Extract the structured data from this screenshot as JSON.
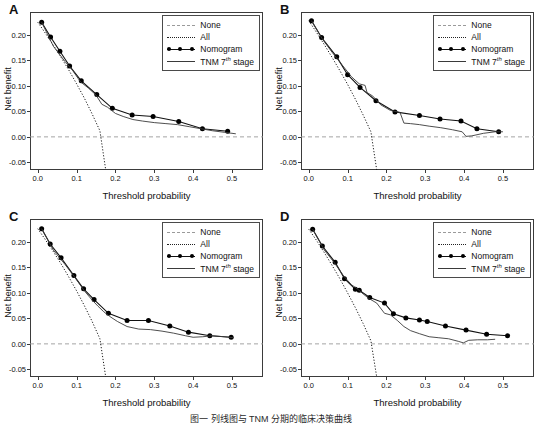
{
  "figure": {
    "caption": "图一 列线图与 TNM 分期的临床决策曲线",
    "panels": [
      "A",
      "B",
      "C",
      "D"
    ]
  },
  "axes": {
    "xlabel": "Threshold probability",
    "ylabel": "Net benefit",
    "xticks": [
      "0.0",
      "0.1",
      "0.2",
      "0.3",
      "0.4",
      "0.5"
    ],
    "xtick_values": [
      0.0,
      0.1,
      0.2,
      0.3,
      0.4,
      0.5
    ],
    "yticks": [
      "-0.05",
      "0.00",
      "0.05",
      "0.10",
      "0.15",
      "0.20"
    ],
    "ytick_values": [
      -0.05,
      0.0,
      0.05,
      0.1,
      0.15,
      0.2
    ],
    "xlim": [
      -0.02,
      0.58
    ],
    "ylim": [
      -0.065,
      0.245
    ]
  },
  "legend": {
    "items": [
      {
        "label": "None",
        "style": "dashed-gray"
      },
      {
        "label": "All",
        "style": "dotted-black"
      },
      {
        "label": "Nomogram",
        "style": "line-with-dots"
      },
      {
        "label": "TNM 7th stage",
        "style": "solid-black",
        "prefix": "TNM 7",
        "superscript": "th",
        "suffix": " stage"
      }
    ]
  },
  "chart_data": {
    "type": "line",
    "xlabel": "Threshold probability",
    "ylabel": "Net benefit",
    "xlim": [
      -0.02,
      0.58
    ],
    "ylim": [
      -0.065,
      0.245
    ],
    "grid": false,
    "legend_position": "top-right",
    "panels": [
      {
        "label": "A",
        "series": [
          {
            "name": "None",
            "type": "horizontal-line",
            "value": 0.0,
            "x": [
              -0.02,
              0.58
            ],
            "y": [
              0.0,
              0.0
            ]
          },
          {
            "name": "All",
            "type": "line",
            "x": [
              0.0,
              0.02,
              0.04,
              0.06,
              0.08,
              0.1,
              0.12,
              0.14,
              0.16,
              0.175
            ],
            "y": [
              0.225,
              0.203,
              0.18,
              0.156,
              0.131,
              0.104,
              0.076,
              0.045,
              0.012,
              -0.065
            ]
          },
          {
            "name": "Nomogram",
            "type": "line-markers",
            "x": [
              0.01,
              0.033,
              0.057,
              0.082,
              0.112,
              0.152,
              0.192,
              0.243,
              0.297,
              0.363,
              0.424,
              0.489
            ],
            "y": [
              0.225,
              0.196,
              0.168,
              0.139,
              0.11,
              0.083,
              0.056,
              0.043,
              0.04,
              0.03,
              0.016,
              0.011
            ]
          },
          {
            "name": "TNM 7th stage",
            "type": "line",
            "x": [
              0.01,
              0.04,
              0.07,
              0.09,
              0.11,
              0.13,
              0.15,
              0.165,
              0.18,
              0.2,
              0.22,
              0.245,
              0.27,
              0.3,
              0.33,
              0.36,
              0.39,
              0.42,
              0.45,
              0.48,
              0.51
            ],
            "y": [
              0.225,
              0.178,
              0.148,
              0.13,
              0.108,
              0.096,
              0.082,
              0.064,
              0.058,
              0.046,
              0.04,
              0.034,
              0.031,
              0.028,
              0.026,
              0.024,
              0.02,
              0.016,
              0.012,
              0.009,
              0.006
            ]
          }
        ]
      },
      {
        "label": "B",
        "series": [
          {
            "name": "None",
            "type": "horizontal-line",
            "value": 0.0,
            "x": [
              -0.02,
              0.58
            ],
            "y": [
              0.0,
              0.0
            ]
          },
          {
            "name": "All",
            "type": "line",
            "x": [
              0.0,
              0.02,
              0.04,
              0.06,
              0.08,
              0.1,
              0.12,
              0.14,
              0.16,
              0.175
            ],
            "y": [
              0.228,
              0.205,
              0.181,
              0.156,
              0.13,
              0.103,
              0.074,
              0.043,
              0.01,
              -0.065
            ]
          },
          {
            "name": "Nomogram",
            "type": "line-markers",
            "x": [
              0.007,
              0.033,
              0.072,
              0.1,
              0.132,
              0.173,
              0.222,
              0.285,
              0.338,
              0.392,
              0.433,
              0.489
            ],
            "y": [
              0.228,
              0.195,
              0.157,
              0.122,
              0.097,
              0.071,
              0.049,
              0.042,
              0.035,
              0.031,
              0.016,
              0.01
            ]
          },
          {
            "name": "TNM 7th stage",
            "type": "line",
            "x": [
              0.007,
              0.035,
              0.06,
              0.085,
              0.11,
              0.13,
              0.145,
              0.15,
              0.165,
              0.185,
              0.21,
              0.235,
              0.245,
              0.262,
              0.285,
              0.31,
              0.34,
              0.37,
              0.395,
              0.405,
              0.42,
              0.45,
              0.48,
              0.5
            ],
            "y": [
              0.228,
              0.192,
              0.166,
              0.142,
              0.118,
              0.104,
              0.101,
              0.087,
              0.08,
              0.063,
              0.052,
              0.048,
              0.027,
              0.026,
              0.024,
              0.021,
              0.018,
              0.014,
              0.01,
              0.001,
              0.002,
              0.007,
              0.01,
              0.01
            ]
          }
        ]
      },
      {
        "label": "C",
        "series": [
          {
            "name": "None",
            "type": "horizontal-line",
            "value": 0.0,
            "x": [
              -0.02,
              0.58
            ],
            "y": [
              0.0,
              0.0
            ]
          },
          {
            "name": "All",
            "type": "line",
            "x": [
              0.0,
              0.02,
              0.04,
              0.06,
              0.08,
              0.1,
              0.12,
              0.14,
              0.16,
              0.175
            ],
            "y": [
              0.226,
              0.204,
              0.181,
              0.157,
              0.131,
              0.104,
              0.075,
              0.044,
              0.01,
              -0.065
            ]
          },
          {
            "name": "Nomogram",
            "type": "line-markers",
            "x": [
              0.01,
              0.032,
              0.06,
              0.093,
              0.118,
              0.145,
              0.182,
              0.23,
              0.285,
              0.34,
              0.388,
              0.443,
              0.498
            ],
            "y": [
              0.226,
              0.196,
              0.169,
              0.134,
              0.108,
              0.087,
              0.06,
              0.046,
              0.046,
              0.035,
              0.023,
              0.016,
              0.013
            ]
          },
          {
            "name": "TNM 7th stage",
            "type": "line",
            "x": [
              0.01,
              0.04,
              0.07,
              0.095,
              0.12,
              0.14,
              0.155,
              0.17,
              0.185,
              0.205,
              0.23,
              0.26,
              0.29,
              0.32,
              0.35,
              0.38,
              0.4,
              0.425,
              0.45,
              0.48,
              0.505
            ],
            "y": [
              0.226,
              0.184,
              0.156,
              0.131,
              0.104,
              0.086,
              0.074,
              0.063,
              0.054,
              0.044,
              0.034,
              0.029,
              0.028,
              0.025,
              0.021,
              0.016,
              0.013,
              0.014,
              0.016,
              0.014,
              0.012
            ]
          }
        ]
      },
      {
        "label": "D",
        "series": [
          {
            "name": "None",
            "type": "horizontal-line",
            "value": 0.0,
            "x": [
              -0.02,
              0.58
            ],
            "y": [
              0.0,
              0.0
            ]
          },
          {
            "name": "All",
            "type": "line",
            "x": [
              0.0,
              0.02,
              0.04,
              0.06,
              0.08,
              0.1,
              0.12,
              0.14,
              0.16,
              0.175
            ],
            "y": [
              0.225,
              0.203,
              0.179,
              0.154,
              0.128,
              0.1,
              0.071,
              0.04,
              0.006,
              -0.065
            ]
          },
          {
            "name": "Nomogram",
            "type": "line-markers",
            "x": [
              0.01,
              0.035,
              0.068,
              0.092,
              0.12,
              0.13,
              0.157,
              0.195,
              0.218,
              0.25,
              0.285,
              0.305,
              0.352,
              0.405,
              0.458,
              0.512
            ],
            "y": [
              0.225,
              0.192,
              0.16,
              0.128,
              0.107,
              0.105,
              0.091,
              0.08,
              0.059,
              0.051,
              0.047,
              0.044,
              0.035,
              0.027,
              0.019,
              0.016
            ]
          },
          {
            "name": "TNM 7th stage",
            "type": "line",
            "x": [
              0.01,
              0.04,
              0.065,
              0.09,
              0.11,
              0.125,
              0.14,
              0.155,
              0.175,
              0.195,
              0.21,
              0.228,
              0.245,
              0.262,
              0.285,
              0.31,
              0.335,
              0.36,
              0.385,
              0.398,
              0.412,
              0.435,
              0.46,
              0.48
            ],
            "y": [
              0.225,
              0.184,
              0.16,
              0.133,
              0.116,
              0.108,
              0.098,
              0.089,
              0.08,
              0.06,
              0.057,
              0.046,
              0.034,
              0.026,
              0.02,
              0.014,
              0.012,
              0.01,
              0.005,
              0.002,
              0.007,
              0.008,
              0.008,
              0.009
            ]
          }
        ]
      }
    ]
  },
  "colors": {
    "none_line": "#9a9a9a",
    "all_line": "#1a1a1a",
    "nomogram_line": "#111111",
    "tnm_line": "#3a3a3a",
    "frame": "#3b3b3b",
    "text": "#111111",
    "background": "#ffffff"
  }
}
